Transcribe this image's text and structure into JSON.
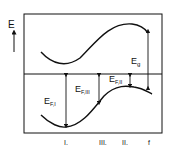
{
  "diagram": {
    "axis_label": "E",
    "labels": {
      "gap": "E",
      "gap_sub": "g",
      "ef1": "E",
      "ef1_sub": "F,I",
      "ef2": "E",
      "ef2_sub": "F,II",
      "ef3": "E",
      "ef3_sub": "F,III"
    },
    "x_ticks": [
      "I.",
      "III.",
      "II.",
      "f"
    ],
    "colors": {
      "ink": "#111111",
      "background": "#ffffff"
    }
  }
}
